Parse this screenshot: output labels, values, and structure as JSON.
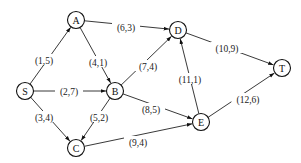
{
  "diagram": {
    "type": "directed-network-flow-graph",
    "node_radius": 8.5,
    "nodes": [
      {
        "id": "S",
        "label": "S",
        "x": 25,
        "y": 91
      },
      {
        "id": "A",
        "label": "A",
        "x": 76,
        "y": 20
      },
      {
        "id": "B",
        "label": "B",
        "x": 115,
        "y": 91
      },
      {
        "id": "C",
        "label": "C",
        "x": 76,
        "y": 148
      },
      {
        "id": "D",
        "label": "D",
        "x": 178,
        "y": 30
      },
      {
        "id": "E",
        "label": "E",
        "x": 201,
        "y": 122
      },
      {
        "id": "T",
        "label": "T",
        "x": 282,
        "y": 68
      }
    ],
    "edges": [
      {
        "from": "S",
        "to": "A",
        "label": "(1,5)",
        "lx": 44,
        "ly": 60
      },
      {
        "from": "S",
        "to": "B",
        "label": "(2,7)",
        "lx": 69,
        "ly": 91
      },
      {
        "from": "S",
        "to": "C",
        "label": "(3,4)",
        "lx": 44,
        "ly": 117
      },
      {
        "from": "A",
        "to": "B",
        "label": "(4,1)",
        "lx": 98,
        "ly": 62
      },
      {
        "from": "A",
        "to": "D",
        "label": "(6,3)",
        "lx": 126,
        "ly": 27
      },
      {
        "from": "B",
        "to": "D",
        "label": "(7,4)",
        "lx": 148,
        "ly": 66
      },
      {
        "from": "B",
        "to": "C",
        "label": "(5,2)",
        "lx": 99,
        "ly": 117
      },
      {
        "from": "B",
        "to": "E",
        "label": "(8,5)",
        "lx": 151,
        "ly": 109
      },
      {
        "from": "C",
        "to": "E",
        "label": "(9,4)",
        "lx": 138,
        "ly": 142
      },
      {
        "from": "E",
        "to": "D",
        "label": "(11,1)",
        "lx": 190,
        "ly": 79
      },
      {
        "from": "D",
        "to": "T",
        "label": "(10,9)",
        "lx": 227,
        "ly": 48
      },
      {
        "from": "E",
        "to": "T",
        "label": "(12,6)",
        "lx": 248,
        "ly": 99
      }
    ]
  }
}
